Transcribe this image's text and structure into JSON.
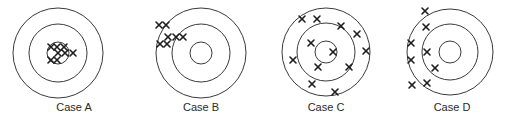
{
  "diagram": {
    "title": "",
    "colors": {
      "ring": "#3a3a3a",
      "mark": "#1e1e1e",
      "label": "#2a2a2a",
      "background": "#ffffff"
    },
    "mark_symbol": "×",
    "mark_size": 3,
    "targets": [
      {
        "id": "A",
        "label": "Case A",
        "center": [
          58,
          53
        ],
        "radii": [
          45,
          29,
          11
        ],
        "label_pos": [
          74,
          111
        ],
        "marks": [
          [
            51,
            47
          ],
          [
            57,
            47
          ],
          [
            64,
            47
          ],
          [
            58,
            53
          ],
          [
            65,
            53
          ],
          [
            73,
            53
          ],
          [
            51,
            60
          ],
          [
            57,
            60
          ]
        ]
      },
      {
        "id": "B",
        "label": "Case B",
        "center": [
          201,
          53
        ],
        "radii": [
          45,
          29,
          11
        ],
        "label_pos": [
          201,
          111
        ],
        "marks": [
          [
            159,
            25
          ],
          [
            166,
            25
          ],
          [
            168,
            37
          ],
          [
            176,
            37
          ],
          [
            183,
            37
          ],
          [
            160,
            44
          ],
          [
            167,
            44
          ]
        ]
      },
      {
        "id": "C",
        "label": "Case C",
        "center": [
          326,
          52
        ],
        "radii": [
          44,
          29,
          11
        ],
        "label_pos": [
          326,
          111
        ],
        "marks": [
          [
            302,
            19
          ],
          [
            317,
            19
          ],
          [
            341,
            26
          ],
          [
            357,
            34
          ],
          [
            311,
            43
          ],
          [
            333,
            52
          ],
          [
            366,
            51
          ],
          [
            293,
            60
          ],
          [
            318,
            67
          ],
          [
            349,
            67
          ],
          [
            312,
            84
          ],
          [
            335,
            92
          ]
        ]
      },
      {
        "id": "D",
        "label": "Case D",
        "center": [
          450,
          52
        ],
        "radii": [
          43,
          28,
          11
        ],
        "label_pos": [
          452,
          111
        ],
        "marks": [
          [
            425,
            11
          ],
          [
            426,
            27
          ],
          [
            411,
            43
          ],
          [
            427,
            52
          ],
          [
            411,
            60
          ],
          [
            435,
            68
          ],
          [
            412,
            85
          ],
          [
            427,
            83
          ]
        ]
      }
    ]
  }
}
